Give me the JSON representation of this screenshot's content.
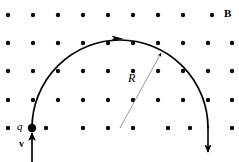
{
  "figure": {
    "background_color": "#ffffff",
    "ink_color": "#000000",
    "radius_line_color": "#8c8c8c",
    "width": 239,
    "height": 162
  },
  "labels": {
    "field": {
      "text": "B",
      "x": 225,
      "y": 9,
      "style": "bold"
    },
    "radius": {
      "text": "R",
      "x": 130,
      "y": 78,
      "style": "italic"
    },
    "charge": {
      "text": "q",
      "x": 17,
      "y": 122,
      "style": "italic"
    },
    "velocity": {
      "text": "v",
      "x": 18,
      "y": 139,
      "style": "bold"
    }
  },
  "field_dots": {
    "symbol": "dot-out-of-page",
    "rows_y": [
      15,
      43,
      71,
      100,
      128
    ],
    "cols_x": [
      8,
      33,
      58,
      83,
      108,
      133,
      158,
      183,
      208,
      232
    ],
    "radius": 2.2,
    "count_per_row": 10,
    "row_count": 5
  },
  "path": {
    "type": "semicircle",
    "center_x": 120,
    "center_y": 128,
    "radius": 88,
    "start": {
      "x": 32,
      "y": 128
    },
    "apex": {
      "x": 120,
      "y": 40
    },
    "end": {
      "x": 208,
      "y": 128
    },
    "stroke_width": 1.6,
    "direction": "counterclockwise-right",
    "arrowheads": [
      {
        "name": "apex-arrow",
        "x": 122,
        "y": 39,
        "angle": 0
      },
      {
        "name": "end-arrow",
        "x": 208,
        "y": 158,
        "angle": 90
      }
    ]
  },
  "velocity_arrow": {
    "x": 32,
    "y_tail": 162,
    "y_head": 130,
    "stroke_width": 1.6,
    "direction": "up"
  },
  "radius_arrow": {
    "x_tail": 120,
    "y_tail": 128,
    "x_head": 163,
    "y_head": 50,
    "stroke_width": 0.9,
    "direction": "up-right"
  },
  "charge_marker": {
    "x": 32,
    "y": 128,
    "radius": 4.2
  }
}
